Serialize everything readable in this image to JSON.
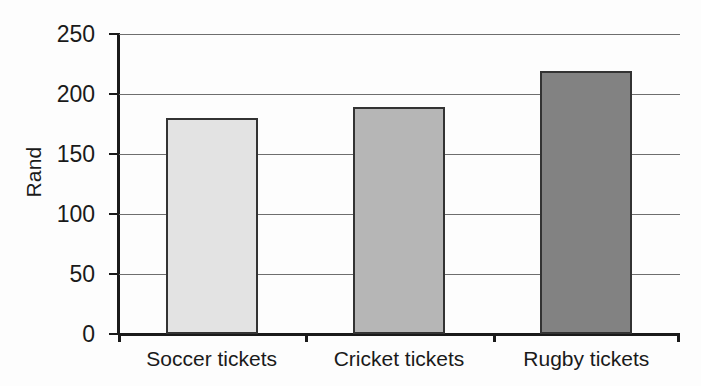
{
  "chart_data": {
    "type": "bar",
    "title": "",
    "xlabel": "",
    "ylabel": "Rand",
    "categories": [
      "Soccer tickets",
      "Cricket tickets",
      "Rugby tickets"
    ],
    "values": [
      180,
      189,
      219
    ],
    "ylim": [
      0,
      250
    ],
    "ytick_labels": [
      "0",
      "50",
      "100",
      "150",
      "200",
      "250"
    ],
    "ytick_values": [
      0,
      50,
      100,
      150,
      200,
      250
    ],
    "grid": true,
    "legend": "none",
    "bar_colors": [
      "#e3e3e3",
      "#b6b6b6",
      "#828282"
    ],
    "bar_edge_color": "#333333",
    "axis_color": "#1a1a1a",
    "grid_color": "#6e6e6e",
    "background": "#fdfdfd"
  }
}
